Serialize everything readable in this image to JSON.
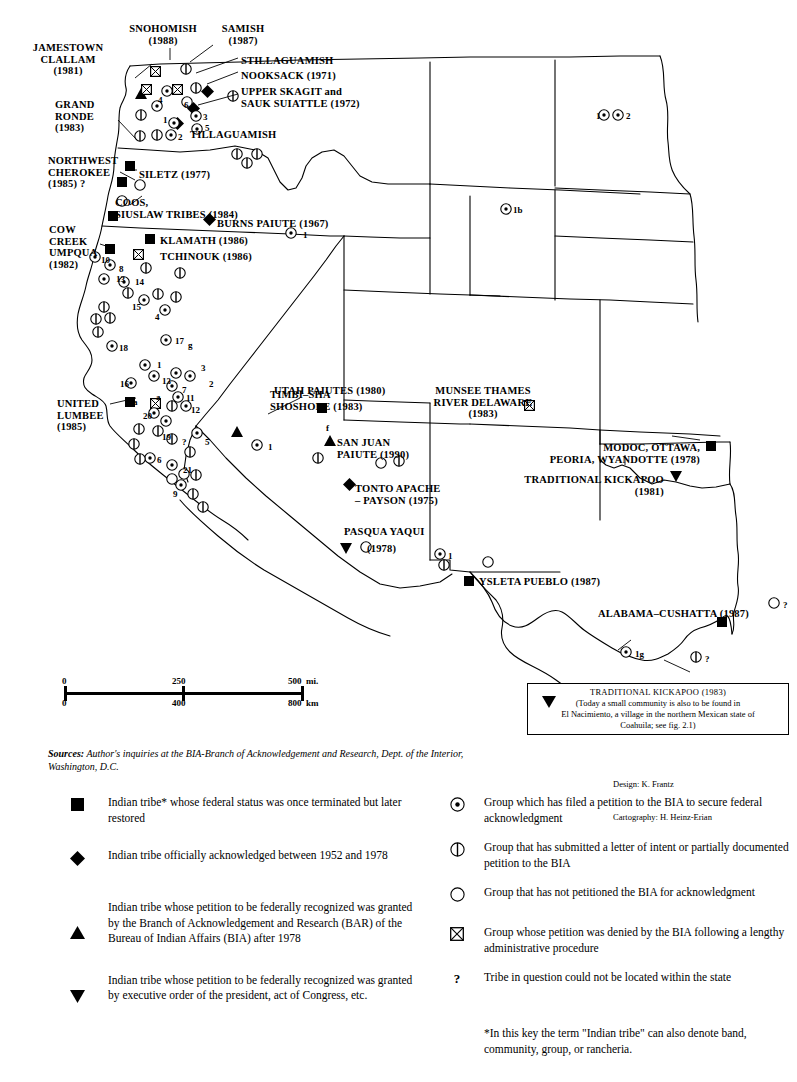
{
  "map": {
    "title_implicit": "Federal acknowledgment status of Indian tribes and groups, western United States",
    "labels": [
      {
        "id": "jamestown-clallam",
        "text": "JAMESTOWN\nCLALLAM\n(1981)",
        "x": 68,
        "y": 42,
        "align": "c"
      },
      {
        "id": "snohomish",
        "text": "SNOHOMISH\n(1988)",
        "x": 163,
        "y": 23,
        "align": "c"
      },
      {
        "id": "samish",
        "text": "SAMISH\n(1987)",
        "x": 243,
        "y": 23,
        "align": "c"
      },
      {
        "id": "stillaguamish",
        "text": "STILLAGUAMISH",
        "x": 241,
        "y": 55,
        "align": "l"
      },
      {
        "id": "nooksack",
        "text": "NOOKSACK (1971)",
        "x": 241,
        "y": 70,
        "align": "l"
      },
      {
        "id": "upper-skagit-sauk-suiattle",
        "text": "UPPER SKAGIT and\nSAUK SUIATTLE (1972)",
        "x": 241,
        "y": 86,
        "align": "l"
      },
      {
        "id": "tillaguamish",
        "text": "TILLAGUAMISH",
        "x": 190,
        "y": 129,
        "align": "l"
      },
      {
        "id": "grand-ronde",
        "text": "GRAND\nRONDE\n(1983)",
        "x": 55,
        "y": 99,
        "align": "l"
      },
      {
        "id": "northwest-cherokee",
        "text": "NORTHWEST\nCHEROKEE\n(1985) ?",
        "x": 48,
        "y": 155,
        "align": "l"
      },
      {
        "id": "siletz",
        "text": "SILETZ (1977)",
        "x": 139,
        "y": 169,
        "align": "l"
      },
      {
        "id": "coos-siuslaw",
        "text": "COOS,\nSIUSLAW TRIBES (1984)",
        "x": 115,
        "y": 197,
        "align": "l"
      },
      {
        "id": "burns-paiute",
        "text": "BURNS PAIUTE (1967)",
        "x": 217,
        "y": 218,
        "align": "l"
      },
      {
        "id": "klamath",
        "text": "KLAMATH (1986)",
        "x": 160,
        "y": 235,
        "align": "l"
      },
      {
        "id": "tchinouk",
        "text": "TCHINOUK (1986)",
        "x": 160,
        "y": 251,
        "align": "l"
      },
      {
        "id": "cow-creek-umpqua",
        "text": "COW\nCREEK\nUMPQUA\n(1982)",
        "x": 49,
        "y": 224,
        "align": "l"
      },
      {
        "id": "united-lumbee",
        "text": "UNITED\nLUMBEE\n(1985)",
        "x": 57,
        "y": 398,
        "align": "l"
      },
      {
        "id": "timbi-sha-shoshone",
        "text": "TIMBI–SHA\nSHOSHONE (1983)",
        "x": 270,
        "y": 389,
        "align": "l"
      },
      {
        "id": "utah-paiutes",
        "text": "UTAH PAIUTES (1980)",
        "x": 274,
        "y": 385,
        "align": "l"
      },
      {
        "id": "munsee-thames",
        "text": "MUNSEE THAMES\nRIVER DELAWARE\n(1983)",
        "x": 483,
        "y": 385,
        "align": "c"
      },
      {
        "id": "san-juan-paiute",
        "text": "SAN JUAN\nPAIUTE (1990)",
        "x": 337,
        "y": 437,
        "align": "l"
      },
      {
        "id": "tonto-apache-payson",
        "text": "TONTO APACHE\n– PAYSON (1975)",
        "x": 355,
        "y": 483,
        "align": "l"
      },
      {
        "id": "pasqua-yaqui",
        "text": "PASQUA YAQUI",
        "x": 344,
        "y": 526,
        "align": "l"
      },
      {
        "id": "pasqua-yaqui-year",
        "text": "(1978)",
        "x": 367,
        "y": 543,
        "align": "l"
      },
      {
        "id": "modoc-ottawa-peoria-wyandotte",
        "text": "MODOC, OTTAWA,\nPEORIA, WYANDOTTE (1978)",
        "x": 700,
        "y": 442,
        "align": "r"
      },
      {
        "id": "traditional-kickapoo",
        "text": "TRADITIONAL KICKAPOO\n(1981)",
        "x": 664,
        "y": 474,
        "align": "r"
      },
      {
        "id": "ysleta-pueblo",
        "text": "YSLETA PUEBLO (1987)",
        "x": 479,
        "y": 576,
        "align": "l"
      },
      {
        "id": "alabama-cushatta",
        "text": "ALABAMA–CUSHATTA (1987)",
        "x": 598,
        "y": 608,
        "align": "l"
      }
    ],
    "numbers": [
      {
        "id": "n-4",
        "text": "4",
        "x": 158,
        "y": 96
      },
      {
        "id": "n-6",
        "text": "6",
        "x": 184,
        "y": 101
      },
      {
        "id": "n-3",
        "text": "3",
        "x": 203,
        "y": 113
      },
      {
        "id": "n-5",
        "text": "5",
        "x": 205,
        "y": 124
      },
      {
        "id": "n-1a",
        "text": "1",
        "x": 163,
        "y": 116
      },
      {
        "id": "n-2a",
        "text": "2",
        "x": 178,
        "y": 133
      },
      {
        "id": "n-1-burns",
        "text": "1",
        "x": 303,
        "y": 231
      },
      {
        "id": "n-1b",
        "text": "1b",
        "x": 513,
        "y": 206
      },
      {
        "id": "n-1-nd",
        "text": "1",
        "x": 596,
        "y": 112
      },
      {
        "id": "n-2-nd",
        "text": "2",
        "x": 626,
        "y": 112
      },
      {
        "id": "n-10",
        "text": "10",
        "x": 101,
        "y": 256
      },
      {
        "id": "n-8",
        "text": "8",
        "x": 119,
        "y": 265
      },
      {
        "id": "n-13",
        "text": "13",
        "x": 116,
        "y": 275
      },
      {
        "id": "n-14",
        "text": "14",
        "x": 135,
        "y": 278
      },
      {
        "id": "n-15",
        "text": "15",
        "x": 132,
        "y": 303
      },
      {
        "id": "n-4b",
        "text": "4",
        "x": 155,
        "y": 313
      },
      {
        "id": "n-18",
        "text": "18",
        "x": 119,
        "y": 344
      },
      {
        "id": "n-17",
        "text": "17",
        "x": 175,
        "y": 337
      },
      {
        "id": "n-g",
        "text": "g",
        "x": 188,
        "y": 341
      },
      {
        "id": "n-1c",
        "text": "1",
        "x": 157,
        "y": 361
      },
      {
        "id": "n-3b",
        "text": "3",
        "x": 201,
        "y": 364
      },
      {
        "id": "n-16",
        "text": "16",
        "x": 120,
        "y": 380
      },
      {
        "id": "n-13b",
        "text": "13",
        "x": 162,
        "y": 377
      },
      {
        "id": "n-2b",
        "text": "2",
        "x": 209,
        "y": 380
      },
      {
        "id": "n-7",
        "text": "7",
        "x": 182,
        "y": 386
      },
      {
        "id": "n-11",
        "text": "11",
        "x": 186,
        "y": 394
      },
      {
        "id": "n-12",
        "text": "12",
        "x": 191,
        "y": 406
      },
      {
        "id": "n-a1",
        "text": "a",
        "x": 133,
        "y": 398
      },
      {
        "id": "n-a2",
        "text": "a",
        "x": 156,
        "y": 393
      },
      {
        "id": "n-20",
        "text": "20",
        "x": 143,
        "y": 412
      },
      {
        "id": "n-19",
        "text": "19",
        "x": 162,
        "y": 433
      },
      {
        "id": "n-q1",
        "text": "?",
        "x": 182,
        "y": 438
      },
      {
        "id": "n-5b",
        "text": "5",
        "x": 205,
        "y": 438
      },
      {
        "id": "n-6b",
        "text": "6",
        "x": 157,
        "y": 456
      },
      {
        "id": "n-21",
        "text": "21",
        "x": 183,
        "y": 466
      },
      {
        "id": "n-9",
        "text": "9",
        "x": 173,
        "y": 490
      },
      {
        "id": "n-1d",
        "text": "1",
        "x": 268,
        "y": 443
      },
      {
        "id": "n-f",
        "text": "f",
        "x": 326,
        "y": 424
      },
      {
        "id": "n-1e",
        "text": "1",
        "x": 448,
        "y": 552
      },
      {
        "id": "n-1g",
        "text": "1g",
        "x": 635,
        "y": 650
      },
      {
        "id": "n-q2",
        "text": "?",
        "x": 705,
        "y": 655
      },
      {
        "id": "n-q3",
        "text": "?",
        "x": 783,
        "y": 601
      }
    ]
  },
  "scalebar": {
    "miles_labels": [
      "0",
      "250",
      "500  mi."
    ],
    "km_labels": [
      "0",
      "400",
      "800  km"
    ]
  },
  "kickapoo_box": {
    "symbol": "triangle-down-icon",
    "line1": "TRADITIONAL KICKAPOO (1983)",
    "line2": "(Today a small community is also to be found in",
    "line3": "El Nacimiento, a village in the northern Mexican state of",
    "line4": "Coahuila; see fig. 2.1)"
  },
  "sources": {
    "label": "Sources:",
    "text": " Author's inquiries at the BIA-Branch of Acknowledgement and Research, Dept. of the Interior, Washington, D.C."
  },
  "credits": {
    "design": "Design: K. Frantz",
    "cartography": "Cartography: H. Heinz-Erian"
  },
  "legend": {
    "left": [
      {
        "symbol": "filled-square-icon",
        "text": "Indian tribe* whose federal status was once terminated but later restored"
      },
      {
        "symbol": "filled-diamond-icon",
        "text": "Indian tribe officially acknowledged between 1952 and 1978"
      },
      {
        "symbol": "filled-triangle-up-icon",
        "text": "Indian tribe whose petition to be federally recognized was granted by the Branch of Acknowledgement and Research (BAR) of the Bureau of Indian Affairs (BIA) after 1978"
      },
      {
        "symbol": "filled-triangle-down-icon",
        "text": "Indian tribe whose petition to be federally recognized was granted by executive order of the president, act of Congress, etc."
      }
    ],
    "right": [
      {
        "symbol": "circle-dot-icon",
        "text": "Group which has filed a petition to the BIA to secure federal acknowledgment"
      },
      {
        "symbol": "circle-half-icon",
        "text": "Group that has submitted a letter of intent or partially documented petition to the BIA"
      },
      {
        "symbol": "circle-open-icon",
        "text": "Group that has not petitioned the BIA for acknowledgment"
      },
      {
        "symbol": "square-x-icon",
        "text": "Group whose petition was denied by the BIA following a lengthy administrative procedure"
      },
      {
        "symbol": "question-mark-icon",
        "text": "Tribe in question could not be located within the state"
      }
    ],
    "footnote": "*In this key the term \"Indian tribe\" can also denote band, community, group, or rancheria."
  },
  "markers": {
    "filled_square": [
      {
        "x": 130,
        "y": 162
      },
      {
        "x": 122,
        "y": 178
      },
      {
        "x": 113,
        "y": 212
      },
      {
        "x": 110,
        "y": 245
      },
      {
        "x": 150,
        "y": 235
      },
      {
        "x": 130,
        "y": 398
      },
      {
        "x": 322,
        "y": 404
      },
      {
        "x": 711,
        "y": 442
      },
      {
        "x": 469,
        "y": 577
      },
      {
        "x": 722,
        "y": 618
      }
    ],
    "filled_diamond": [
      {
        "x": 207,
        "y": 90
      },
      {
        "x": 193,
        "y": 107
      },
      {
        "x": 177,
        "y": 122
      },
      {
        "x": 209,
        "y": 218
      },
      {
        "x": 349,
        "y": 483
      }
    ],
    "filled_triangle_up": [
      {
        "x": 141,
        "y": 90
      },
      {
        "x": 237,
        "y": 428
      },
      {
        "x": 330,
        "y": 437
      }
    ],
    "filled_triangle_down": [
      {
        "x": 346,
        "y": 545
      },
      {
        "x": 676,
        "y": 473
      }
    ],
    "square_x": [
      {
        "x": 155,
        "y": 68
      },
      {
        "x": 146,
        "y": 86
      },
      {
        "x": 177,
        "y": 86
      },
      {
        "x": 138,
        "y": 251
      },
      {
        "x": 155,
        "y": 400
      },
      {
        "x": 529,
        "y": 402
      }
    ],
    "circle_dot": [
      {
        "x": 167,
        "y": 89
      },
      {
        "x": 157,
        "y": 104
      },
      {
        "x": 174,
        "y": 121
      },
      {
        "x": 196,
        "y": 114
      },
      {
        "x": 197,
        "y": 127
      },
      {
        "x": 171,
        "y": 133
      },
      {
        "x": 95,
        "y": 255
      },
      {
        "x": 110,
        "y": 263
      },
      {
        "x": 104,
        "y": 277
      },
      {
        "x": 124,
        "y": 280
      },
      {
        "x": 144,
        "y": 298
      },
      {
        "x": 165,
        "y": 308
      },
      {
        "x": 112,
        "y": 344
      },
      {
        "x": 166,
        "y": 338
      },
      {
        "x": 145,
        "y": 363
      },
      {
        "x": 154,
        "y": 374
      },
      {
        "x": 131,
        "y": 381
      },
      {
        "x": 176,
        "y": 371
      },
      {
        "x": 190,
        "y": 374
      },
      {
        "x": 172,
        "y": 384
      },
      {
        "x": 178,
        "y": 395
      },
      {
        "x": 186,
        "y": 404
      },
      {
        "x": 154,
        "y": 411
      },
      {
        "x": 166,
        "y": 419
      },
      {
        "x": 197,
        "y": 431
      },
      {
        "x": 150,
        "y": 456
      },
      {
        "x": 172,
        "y": 463
      },
      {
        "x": 181,
        "y": 483
      },
      {
        "x": 291,
        "y": 231
      },
      {
        "x": 506,
        "y": 207
      },
      {
        "x": 604,
        "y": 113
      },
      {
        "x": 618,
        "y": 113
      },
      {
        "x": 257,
        "y": 443
      },
      {
        "x": 440,
        "y": 552
      },
      {
        "x": 626,
        "y": 650
      }
    ],
    "circle_half": [
      {
        "x": 186,
        "y": 67
      },
      {
        "x": 196,
        "y": 86
      },
      {
        "x": 233,
        "y": 94
      },
      {
        "x": 141,
        "y": 113
      },
      {
        "x": 140,
        "y": 134
      },
      {
        "x": 157,
        "y": 133
      },
      {
        "x": 237,
        "y": 152
      },
      {
        "x": 257,
        "y": 152
      },
      {
        "x": 247,
        "y": 161
      },
      {
        "x": 146,
        "y": 266
      },
      {
        "x": 180,
        "y": 271
      },
      {
        "x": 128,
        "y": 291
      },
      {
        "x": 158,
        "y": 292
      },
      {
        "x": 176,
        "y": 295
      },
      {
        "x": 104,
        "y": 305
      },
      {
        "x": 96,
        "y": 317
      },
      {
        "x": 110,
        "y": 316
      },
      {
        "x": 98,
        "y": 330
      },
      {
        "x": 172,
        "y": 404
      },
      {
        "x": 158,
        "y": 429
      },
      {
        "x": 172,
        "y": 437
      },
      {
        "x": 139,
        "y": 427
      },
      {
        "x": 134,
        "y": 442
      },
      {
        "x": 140,
        "y": 457
      },
      {
        "x": 190,
        "y": 450
      },
      {
        "x": 196,
        "y": 473
      },
      {
        "x": 193,
        "y": 492
      },
      {
        "x": 203,
        "y": 505
      },
      {
        "x": 318,
        "y": 456
      },
      {
        "x": 399,
        "y": 459
      },
      {
        "x": 444,
        "y": 563
      },
      {
        "x": 696,
        "y": 655
      }
    ],
    "circle_open": [
      {
        "x": 187,
        "y": 100
      },
      {
        "x": 140,
        "y": 183
      },
      {
        "x": 122,
        "y": 199
      },
      {
        "x": 172,
        "y": 477
      },
      {
        "x": 184,
        "y": 472
      },
      {
        "x": 381,
        "y": 461
      },
      {
        "x": 366,
        "y": 545
      },
      {
        "x": 488,
        "y": 560
      },
      {
        "x": 774,
        "y": 601
      }
    ]
  }
}
